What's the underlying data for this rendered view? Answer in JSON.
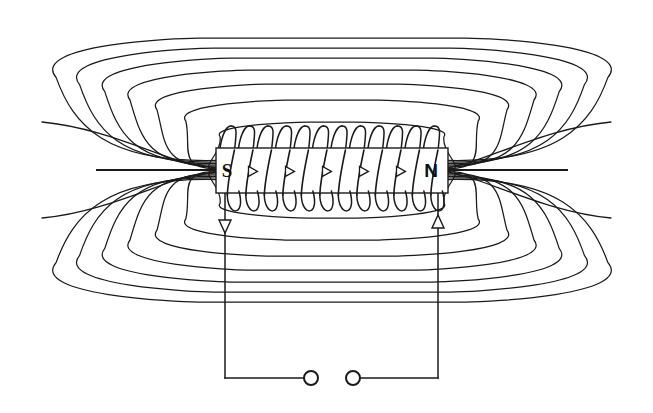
{
  "figure": {
    "background_color": "#ffffff",
    "line_color": "#1a1a1a",
    "width": 653,
    "height": 413
  },
  "solenoid": {
    "core_label": "solenoid-core",
    "pole_left": "S",
    "pole_right": "N",
    "turns": 12,
    "current_arrow_direction": "right",
    "core_rect": {
      "x": 216,
      "y": 148,
      "width": 232,
      "height": 45
    },
    "coil_top_rise": 22,
    "coil_bottom_drop": 24
  },
  "leads": {
    "left_lead_x": 225,
    "right_lead_x": 438,
    "bottom_wire_y": 378,
    "left_arrow_direction": "down",
    "right_arrow_direction": "up",
    "left_arrow_y": 228,
    "right_arrow_y": 222
  },
  "terminals": {
    "count": 2,
    "left_terminal": {
      "cx": 311,
      "cy": 378,
      "r": 7
    },
    "right_terminal": {
      "cx": 353,
      "cy": 378,
      "r": 7
    },
    "style": "open-circle"
  },
  "field_lines": {
    "description": "Nested closed magnetic flux loops emerging from N pole and returning to S pole",
    "loop_count_upper": 7,
    "loop_count_lower": 7,
    "open_line_count": 2,
    "axis_y": 170,
    "left_pole_x": 216,
    "right_pole_x": 448
  },
  "chart_data": {
    "type": "line",
    "xlabel": "",
    "ylabel": "",
    "series": [
      {
        "name": "flux-loop-1",
        "half_width": 40,
        "half_height": 48
      },
      {
        "name": "flux-loop-2",
        "half_width": 78,
        "half_height": 70
      },
      {
        "name": "flux-loop-3",
        "half_width": 110,
        "half_height": 86
      },
      {
        "name": "flux-loop-4",
        "half_width": 140,
        "half_height": 100
      },
      {
        "name": "flux-loop-5",
        "half_width": 168,
        "half_height": 112
      },
      {
        "name": "flux-loop-6",
        "half_width": 196,
        "half_height": 122
      },
      {
        "name": "flux-loop-7",
        "half_width": 222,
        "half_height": 132
      }
    ]
  }
}
